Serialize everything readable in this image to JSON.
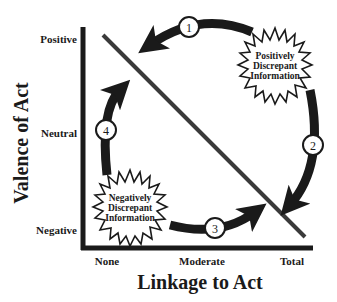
{
  "diagram": {
    "type": "cycle-diagram",
    "x_axis": {
      "title": "Linkage to Act",
      "ticks": [
        "None",
        "Moderate",
        "Total"
      ]
    },
    "y_axis": {
      "title": "Valence of Act",
      "ticks": [
        "Positive",
        "Neutral",
        "Negative"
      ]
    },
    "bursts": [
      {
        "id": "positive",
        "lines": [
          "Positively",
          "Discrepant",
          "Information"
        ]
      },
      {
        "id": "negative",
        "lines": [
          "Negatively",
          "Discrepant",
          "Information"
        ]
      }
    ],
    "steps": [
      "1",
      "2",
      "3",
      "4"
    ],
    "colors": {
      "ink": "#1a1a1a",
      "diagonal": "#3a3a3a",
      "background": "#ffffff"
    }
  }
}
